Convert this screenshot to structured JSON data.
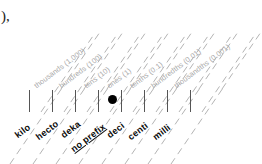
{
  "diagram": {
    "type": "place-value-chart",
    "stray_text": "),",
    "decimal_point_marker": "●",
    "colors": {
      "place_label": "#a8a8a8",
      "prefix_label": "#0a0a0a",
      "grid_line": "#b4b4b4",
      "tick": "#555555",
      "background": "#ffffff"
    },
    "columns": [
      {
        "prefix": "kilo",
        "place": "thousands (1,000)",
        "value": "1,000",
        "underlined": false
      },
      {
        "prefix": "hecto",
        "place": "hundreds (100)",
        "value": "100",
        "underlined": false
      },
      {
        "prefix": "deka",
        "place": "tens (10)",
        "value": "10",
        "underlined": false
      },
      {
        "prefix": "no prefix",
        "place": "ones (1)",
        "value": "1",
        "underlined": true
      },
      {
        "prefix": "deci",
        "place": "tenths (0.1)",
        "value": "0.1",
        "underlined": false
      },
      {
        "prefix": "centi",
        "place": "hundredths (0.01)",
        "value": "0.01",
        "underlined": false
      },
      {
        "prefix": "milli",
        "place": "thousandths (0.001)",
        "value": "0.001",
        "underlined": false
      }
    ]
  }
}
